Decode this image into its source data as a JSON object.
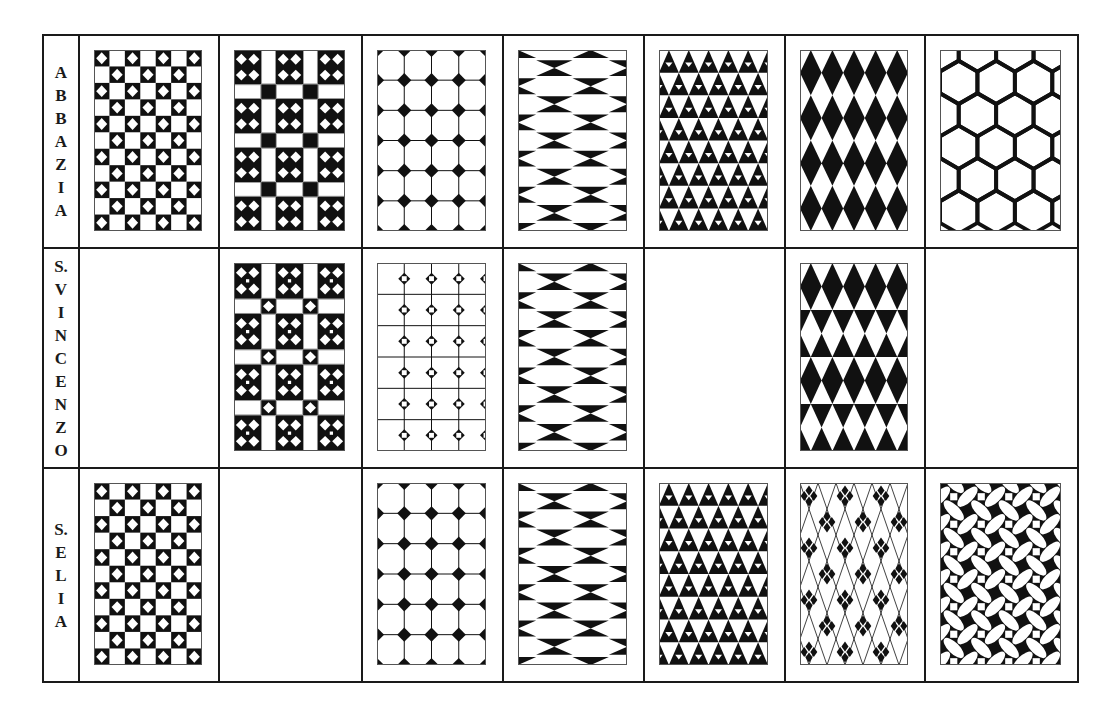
{
  "figure": {
    "columns": 7,
    "row_heights": [
      213,
      220,
      214
    ],
    "column_widths": [
      34,
      138,
      141,
      139,
      139,
      139,
      138,
      151
    ],
    "colors": {
      "ink": "#111111",
      "paper": "#ffffff",
      "border": "#1a1a1a"
    }
  },
  "rows": [
    {
      "label": "ABBAZIA",
      "label_letters": [
        "A",
        "B",
        "B",
        "A",
        "Z",
        "I",
        "A"
      ],
      "cells": [
        {
          "pattern": "checker-diamonds",
          "present": true
        },
        {
          "pattern": "four-diamond-blocks-squares",
          "present": true
        },
        {
          "pattern": "octagons-diamonds",
          "present": true
        },
        {
          "pattern": "hexagons-hourglass",
          "present": true
        },
        {
          "pattern": "triangles",
          "present": true
        },
        {
          "pattern": "harlequin-diamonds",
          "present": true
        },
        {
          "pattern": "hexagon-lens-outline",
          "present": true
        }
      ]
    },
    {
      "label": "S.VINCENZO",
      "label_letters": [
        "S.",
        "V",
        "I",
        "N",
        "C",
        "E",
        "N",
        "Z",
        "O"
      ],
      "cells": [
        {
          "pattern": "empty",
          "present": false
        },
        {
          "pattern": "four-diamond-blocks-diamonds",
          "present": true
        },
        {
          "pattern": "octagons-ring-nodes",
          "present": true
        },
        {
          "pattern": "hexagons-hourglass",
          "present": true
        },
        {
          "pattern": "empty",
          "present": false
        },
        {
          "pattern": "banded-harlequin",
          "present": true
        },
        {
          "pattern": "empty",
          "present": false
        }
      ]
    },
    {
      "label": "S.ELIA",
      "label_letters": [
        "S.",
        "E",
        "L",
        "I",
        "A"
      ],
      "cells": [
        {
          "pattern": "checker-diamonds",
          "present": true
        },
        {
          "pattern": "empty",
          "present": false
        },
        {
          "pattern": "octagons-diamonds",
          "present": true
        },
        {
          "pattern": "hexagons-hourglass",
          "present": true
        },
        {
          "pattern": "triangles",
          "present": true
        },
        {
          "pattern": "lattice-diamond-clusters",
          "present": true
        },
        {
          "pattern": "quatrefoil-circles-squares",
          "present": true
        }
      ]
    }
  ]
}
